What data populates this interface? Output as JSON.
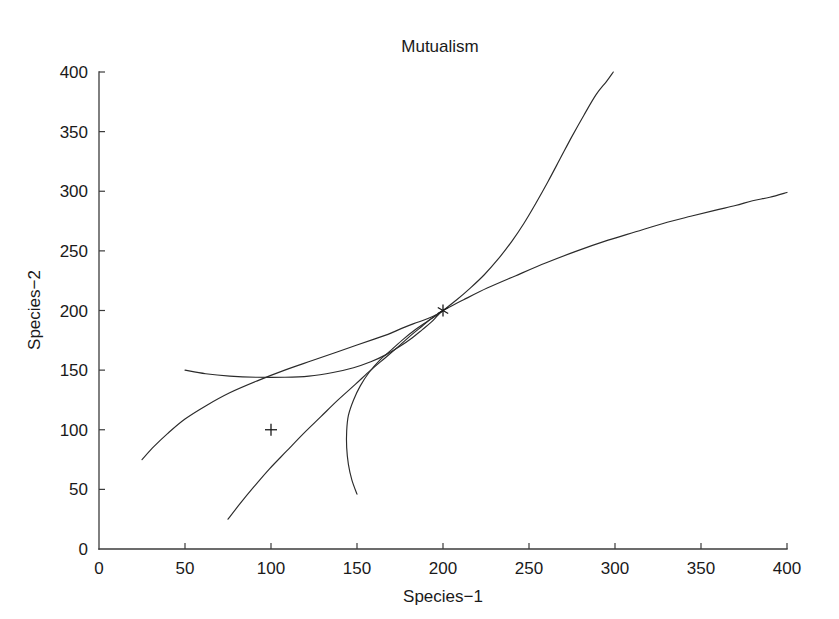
{
  "chart_data": {
    "type": "line",
    "title": "Mutualism",
    "xlabel": "Species−1",
    "ylabel": "Species−2",
    "xlim": [
      0,
      400
    ],
    "ylim": [
      0,
      400
    ],
    "xticks": [
      0,
      50,
      100,
      150,
      200,
      250,
      300,
      350,
      400
    ],
    "yticks": [
      0,
      50,
      100,
      150,
      200,
      250,
      300,
      350,
      400
    ],
    "xtick_labels": [
      "0",
      "50",
      "100",
      "150",
      "200",
      "250",
      "300",
      "350",
      "400"
    ],
    "ytick_labels": [
      "0",
      "50",
      "100",
      "150",
      "200",
      "250",
      "300",
      "350",
      "400"
    ],
    "grid": false,
    "legend": "none",
    "line_color": "#2b2b2b",
    "axis_color": "#3b3b3b",
    "background_color": "#ffffff",
    "annotations": [
      {
        "name": "equilibrium-marker",
        "marker": "asterisk",
        "x": 200,
        "y": 200,
        "label": ""
      },
      {
        "name": "initial-condition-marker",
        "marker": "plus",
        "x": 100,
        "y": 100,
        "label": ""
      }
    ],
    "series": [
      {
        "name": "trajectory-1",
        "points": [
          [
            25,
            75
          ],
          [
            32,
            86
          ],
          [
            40,
            97
          ],
          [
            50,
            109
          ],
          [
            62,
            120
          ],
          [
            76,
            131
          ],
          [
            92,
            141
          ],
          [
            108,
            150
          ],
          [
            124,
            158
          ],
          [
            138,
            165
          ],
          [
            150,
            171
          ],
          [
            160,
            176
          ],
          [
            168,
            180
          ],
          [
            176,
            185
          ],
          [
            183,
            189
          ],
          [
            189,
            192
          ],
          [
            194,
            195
          ],
          [
            198,
            198
          ],
          [
            200,
            200
          ]
        ]
      },
      {
        "name": "trajectory-2",
        "points": [
          [
            50,
            150
          ],
          [
            62,
            147
          ],
          [
            76,
            145
          ],
          [
            92,
            144
          ],
          [
            108,
            144
          ],
          [
            122,
            145
          ],
          [
            136,
            148
          ],
          [
            148,
            152
          ],
          [
            158,
            157
          ],
          [
            167,
            163
          ],
          [
            175,
            170
          ],
          [
            182,
            177
          ],
          [
            188,
            184
          ],
          [
            193,
            190
          ],
          [
            197,
            196
          ],
          [
            200,
            200
          ]
        ]
      },
      {
        "name": "trajectory-3",
        "points": [
          [
            75,
            25
          ],
          [
            82,
            38
          ],
          [
            90,
            52
          ],
          [
            99,
            67
          ],
          [
            109,
            82
          ],
          [
            119,
            97
          ],
          [
            129,
            111
          ],
          [
            139,
            125
          ],
          [
            149,
            138
          ],
          [
            158,
            150
          ],
          [
            167,
            161
          ],
          [
            175,
            171
          ],
          [
            182,
            180
          ],
          [
            188,
            187
          ],
          [
            193,
            193
          ],
          [
            197,
            197
          ],
          [
            200,
            200
          ]
        ]
      },
      {
        "name": "trajectory-4",
        "points": [
          [
            150,
            46
          ],
          [
            147,
            58
          ],
          [
            145,
            71
          ],
          [
            144,
            85
          ],
          [
            144,
            99
          ],
          [
            145,
            112
          ],
          [
            148,
            125
          ],
          [
            152,
            137
          ],
          [
            157,
            148
          ],
          [
            163,
            158
          ],
          [
            170,
            167
          ],
          [
            177,
            176
          ],
          [
            184,
            184
          ],
          [
            190,
            190
          ],
          [
            195,
            195
          ],
          [
            200,
            200
          ]
        ]
      },
      {
        "name": "trajectory-5",
        "points": [
          [
            200,
            200
          ],
          [
            208,
            209
          ],
          [
            216,
            219
          ],
          [
            224,
            230
          ],
          [
            232,
            243
          ],
          [
            240,
            258
          ],
          [
            247,
            273
          ],
          [
            254,
            290
          ],
          [
            261,
            308
          ],
          [
            268,
            327
          ],
          [
            275,
            346
          ],
          [
            282,
            364
          ],
          [
            289,
            381
          ],
          [
            295,
            392
          ],
          [
            299,
            400
          ]
        ]
      },
      {
        "name": "trajectory-6",
        "points": [
          [
            200,
            200
          ],
          [
            212,
            209
          ],
          [
            226,
            219
          ],
          [
            242,
            229
          ],
          [
            260,
            240
          ],
          [
            278,
            250
          ],
          [
            296,
            259
          ],
          [
            312,
            266
          ],
          [
            328,
            273
          ],
          [
            344,
            279
          ],
          [
            358,
            284
          ],
          [
            370,
            288
          ],
          [
            380,
            292
          ],
          [
            390,
            295
          ],
          [
            400,
            299
          ]
        ]
      }
    ]
  }
}
